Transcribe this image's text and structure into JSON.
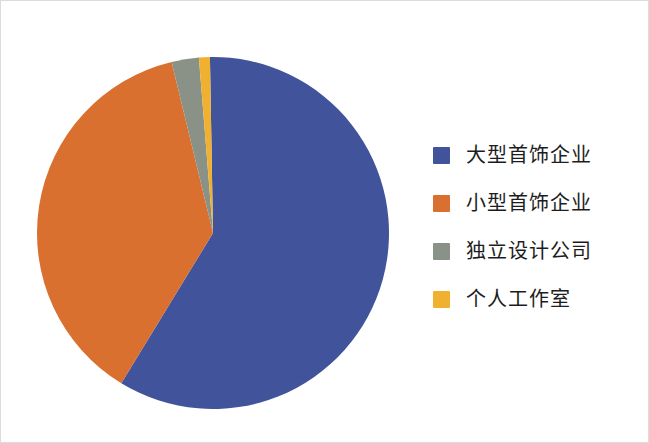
{
  "chart_data": {
    "type": "pie",
    "title": "",
    "subtitle": "",
    "xlabel": "",
    "ylabel": "",
    "grid": false,
    "legend_position": "right",
    "start_angle_deg": -1,
    "direction": "clockwise",
    "center": {
      "x": 212,
      "y": 232
    },
    "radius": 176,
    "categories": [
      "大型首饰企业",
      "小型首饰企业",
      "独立设计公司",
      "个人工作室"
    ],
    "values": [
      59,
      37.5,
      2.5,
      1
    ],
    "unit": "%",
    "colors": [
      "#40539b",
      "#d9702f",
      "#8a9287",
      "#f0b030"
    ],
    "slices": [
      {
        "label": "大型首饰企业",
        "value": 59,
        "color": "#40539b",
        "start_deg": -1,
        "end_deg": 211.4
      },
      {
        "label": "小型首饰企业",
        "value": 37.5,
        "color": "#d9702f",
        "start_deg": 211.4,
        "end_deg": 346.4
      },
      {
        "label": "独立设计公司",
        "value": 2.5,
        "color": "#8a9287",
        "start_deg": 346.4,
        "end_deg": 355.4
      },
      {
        "label": "个人工作室",
        "value": 1,
        "color": "#f0b030",
        "start_deg": 355.4,
        "end_deg": 359
      }
    ]
  },
  "legend": {
    "items": [
      {
        "label": "大型首饰企业",
        "color": "#40539b"
      },
      {
        "label": "小型首饰企业",
        "color": "#d9702f"
      },
      {
        "label": "独立设计公司",
        "color": "#8a9287"
      },
      {
        "label": "个人工作室",
        "color": "#f0b030"
      }
    ]
  }
}
